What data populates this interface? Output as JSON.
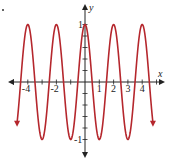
{
  "chart_data": {
    "type": "line",
    "title": "",
    "function": "y = cos(πx)",
    "xlabel": "x",
    "ylabel": "y",
    "xlim": [
      -5,
      5
    ],
    "ylim": [
      -1.2,
      1.2
    ],
    "x_tick_labels": [
      "-4",
      "-2",
      "1",
      "2",
      "3",
      "4"
    ],
    "y_tick_labels": [
      "1",
      "-1"
    ],
    "grid": false,
    "series": [
      {
        "name": "cos(πx)",
        "color": "#b5272d",
        "x": [
          -4.75,
          -4,
          -3.5,
          -3,
          -2.5,
          -2,
          -1.5,
          -1,
          -0.5,
          0,
          0.5,
          1,
          1.5,
          2,
          2.5,
          3,
          3.5,
          4,
          4.75
        ],
        "y": [
          -0.71,
          1,
          0,
          -1,
          0,
          1,
          0,
          -1,
          0,
          1,
          0,
          -1,
          0,
          1,
          0,
          -1,
          0,
          1,
          -0.71
        ]
      }
    ]
  },
  "axes": {
    "x_label": "x",
    "y_label": "y",
    "x_ticks": [
      {
        "value": -4,
        "label": "-4"
      },
      {
        "value": -2,
        "label": "-2"
      },
      {
        "value": 1,
        "label": "1"
      },
      {
        "value": 2,
        "label": "2"
      },
      {
        "value": 3,
        "label": "3"
      },
      {
        "value": 4,
        "label": "4"
      }
    ],
    "y_ticks": [
      {
        "value": 1,
        "label": "1"
      },
      {
        "value": -1,
        "label": "-1"
      }
    ]
  },
  "colors": {
    "curve": "#b5272d",
    "axis": "#222222"
  }
}
